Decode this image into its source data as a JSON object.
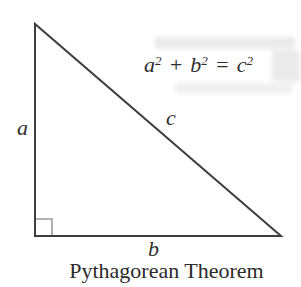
{
  "figure": {
    "caption": "Pythagorean Theorem",
    "labels": {
      "side_a": "a",
      "side_b": "b",
      "hypotenuse": "c"
    },
    "formula": {
      "a_base": "a",
      "a_exp": "2",
      "plus_sign": "+",
      "b_base": "b",
      "b_exp": "2",
      "equals_sign": "=",
      "c_base": "c",
      "c_exp": "2"
    },
    "colors": {
      "line": "#3e3e3e",
      "right_angle_marker": "#9b9b9b",
      "text": "#2e2e2e",
      "background": "#ffffff"
    }
  }
}
